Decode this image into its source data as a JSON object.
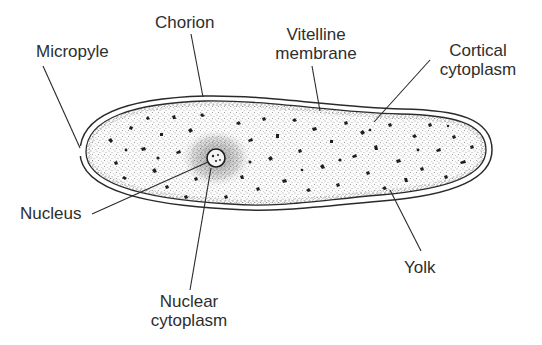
{
  "diagram": {
    "colors": {
      "line": "#2a2a2a",
      "text": "#2e2e2e",
      "background": "#ffffff",
      "stipple": "#3a3a3a"
    },
    "labels": {
      "chorion": "Chorion",
      "micropyle": "Micropyle",
      "vitelline_line1": "Vitelline",
      "vitelline_line2": "membrane",
      "cortical_line1": "Cortical",
      "cortical_line2": "cytoplasm",
      "nucleus": "Nucleus",
      "nuclear_line1": "Nuclear",
      "nuclear_line2": "cytoplasm",
      "yolk": "Yolk"
    }
  }
}
